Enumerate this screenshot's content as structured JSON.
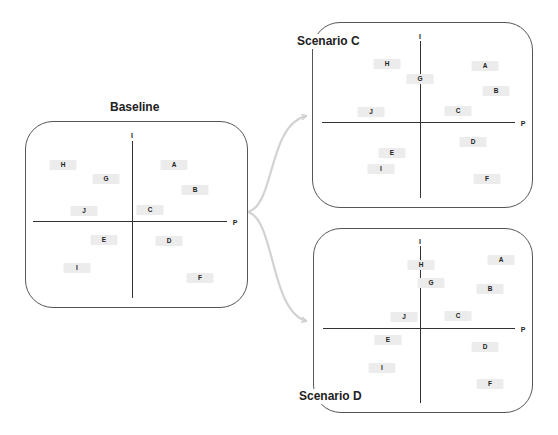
{
  "diagram": {
    "axis_labels": {
      "vertical": "I",
      "horizontal": "P"
    },
    "colors": {
      "panel_border": "#555555",
      "axis": "#333333",
      "item_bg": "#ececec",
      "arrow": "#cccccc"
    },
    "panels": [
      {
        "id": "baseline",
        "title": "Baseline",
        "items": [
          {
            "label": "H",
            "x": 63,
            "y": 165
          },
          {
            "label": "G",
            "x": 106,
            "y": 179
          },
          {
            "label": "A",
            "x": 174,
            "y": 165
          },
          {
            "label": "B",
            "x": 195,
            "y": 190
          },
          {
            "label": "J",
            "x": 84,
            "y": 211
          },
          {
            "label": "C",
            "x": 150,
            "y": 210
          },
          {
            "label": "E",
            "x": 104,
            "y": 240
          },
          {
            "label": "D",
            "x": 169,
            "y": 241
          },
          {
            "label": "I",
            "x": 77,
            "y": 268
          },
          {
            "label": "F",
            "x": 200,
            "y": 278
          }
        ]
      },
      {
        "id": "scenario-c",
        "title": "Scenario C",
        "items": [
          {
            "label": "H",
            "x": 387,
            "y": 64
          },
          {
            "label": "G",
            "x": 420,
            "y": 79
          },
          {
            "label": "A",
            "x": 485,
            "y": 66
          },
          {
            "label": "B",
            "x": 496,
            "y": 91
          },
          {
            "label": "J",
            "x": 371,
            "y": 112
          },
          {
            "label": "C",
            "x": 458,
            "y": 111
          },
          {
            "label": "D",
            "x": 473,
            "y": 142
          },
          {
            "label": "E",
            "x": 392,
            "y": 153
          },
          {
            "label": "I",
            "x": 381,
            "y": 169
          },
          {
            "label": "F",
            "x": 487,
            "y": 179
          }
        ]
      },
      {
        "id": "scenario-d",
        "title": "Scenario D",
        "items": [
          {
            "label": "H",
            "x": 421,
            "y": 265
          },
          {
            "label": "G",
            "x": 431,
            "y": 283
          },
          {
            "label": "A",
            "x": 501,
            "y": 260
          },
          {
            "label": "B",
            "x": 490,
            "y": 289
          },
          {
            "label": "J",
            "x": 404,
            "y": 317
          },
          {
            "label": "C",
            "x": 458,
            "y": 316
          },
          {
            "label": "E",
            "x": 388,
            "y": 340
          },
          {
            "label": "D",
            "x": 485,
            "y": 347
          },
          {
            "label": "I",
            "x": 382,
            "y": 368
          },
          {
            "label": "F",
            "x": 490,
            "y": 384
          }
        ]
      }
    ]
  }
}
